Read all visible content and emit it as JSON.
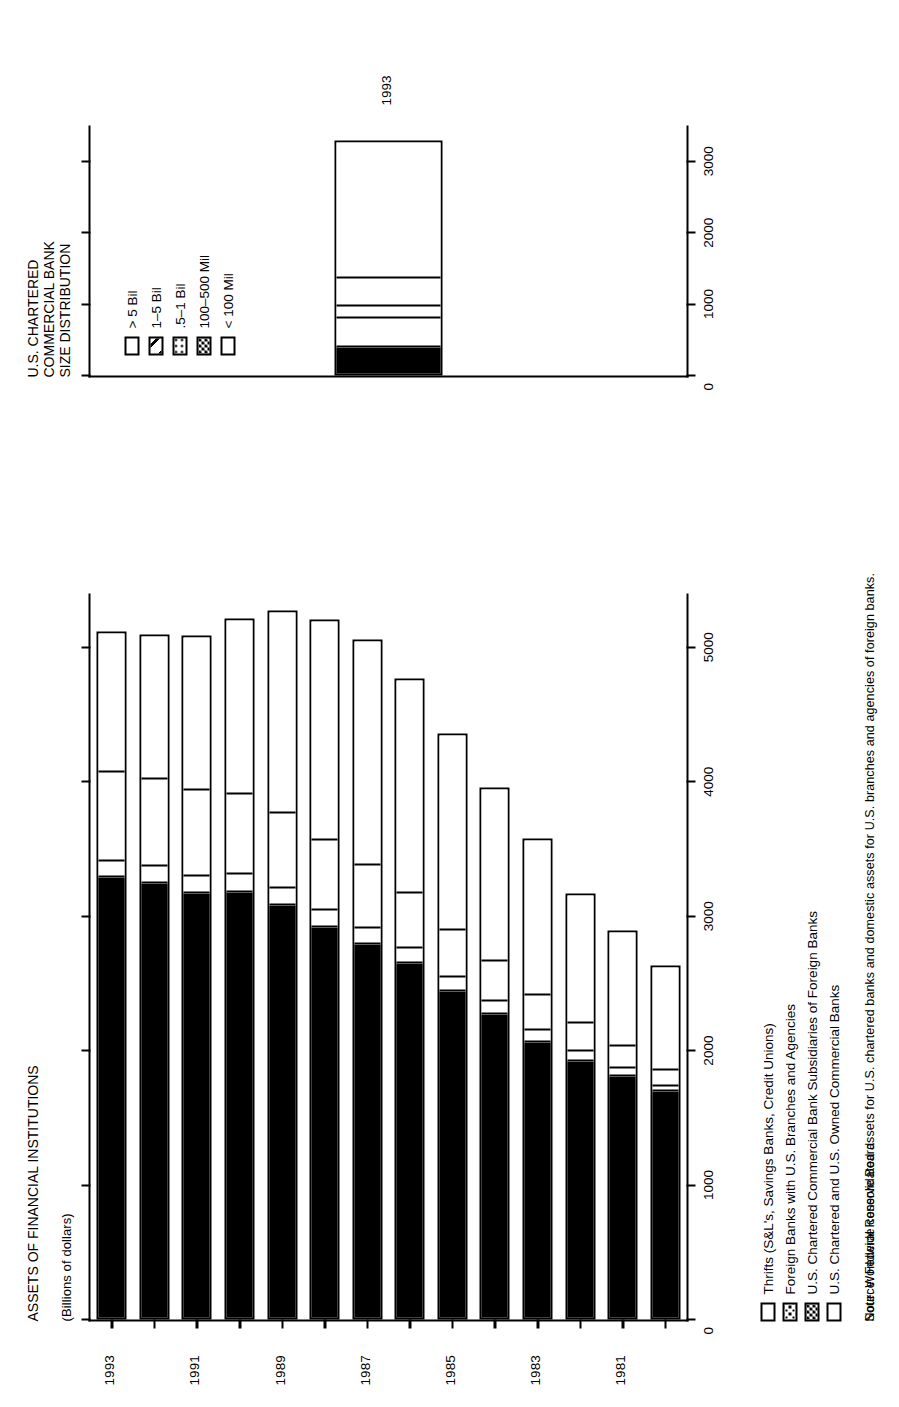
{
  "main_chart": {
    "title_lines": [
      "ASSETS OF FINANCIAL INSTITUTIONS"
    ],
    "subtitle": "(Billions of dollars)",
    "axis_title": "",
    "value_ticks": [
      "0",
      "1000",
      "2000",
      "3000",
      "4000",
      "5000"
    ],
    "year_labels": [
      "1981",
      "1983",
      "1985",
      "1987",
      "1989",
      "1991",
      "1993"
    ],
    "legend": [
      {
        "label": "Thrifts (S&L's, Savings Banks, Credit Unions)",
        "pattern": "open"
      },
      {
        "label": "Foreign Banks with U.S. Branches and Agencies",
        "pattern": "dots2"
      },
      {
        "label": "U.S. Chartered Commercial Bank Subsidiaries of  Foreign Banks",
        "pattern": "checks"
      },
      {
        "label": "U.S. Chartered and U.S. Owned Commercial Banks",
        "pattern": "solid"
      }
    ]
  },
  "secondary_chart": {
    "title_lines": [
      "U.S. CHARTERED",
      "COMMERCIAL BANK",
      "SIZE DISTRIBUTION"
    ],
    "value_ticks": [
      "0",
      "1000",
      "2000",
      "3000"
    ],
    "year_label": "1993",
    "legend": [
      {
        "label": "> 5 Bil",
        "pattern": "open"
      },
      {
        "label": "1–5 Bil",
        "pattern": "hatch"
      },
      {
        "label": ".5–1 Bil",
        "pattern": "dots"
      },
      {
        "label": "100–500 Mil",
        "pattern": "checks"
      },
      {
        "label": "< 100 Mil",
        "pattern": "solid"
      }
    ]
  },
  "footnotes": {
    "note": "Note: Worldwide consolidated assets for U.S. chartered banks and domestic assets for U.S. branches and agencies of foreign banks.",
    "source": "Source: Federal Reserve Board"
  },
  "chart_data": [
    {
      "type": "bar",
      "orientation": "horizontal",
      "stacked": true,
      "title": "Assets of Financial Institutions",
      "subtitle": "(Billions of dollars)",
      "xlabel": "",
      "ylabel": "Billions of dollars",
      "xlim": [
        0,
        5400
      ],
      "ylim": [
        0,
        5400
      ],
      "grid": false,
      "legend_position": "below-left",
      "categories": [
        "1980",
        "1981",
        "1982",
        "1983",
        "1984",
        "1985",
        "1986",
        "1987",
        "1988",
        "1989",
        "1990",
        "1991",
        "1992",
        "1993"
      ],
      "tick_values": [
        0,
        1000,
        2000,
        3000,
        4000,
        5000
      ],
      "labeled_categories": [
        "1981",
        "1983",
        "1985",
        "1987",
        "1989",
        "1991",
        "1993"
      ],
      "series": [
        {
          "name": "U.S. Chartered and U.S. Owned Commercial Banks",
          "pattern": "solid",
          "values": [
            1700,
            1810,
            1920,
            2060,
            2270,
            2440,
            2650,
            2790,
            2920,
            3080,
            3180,
            3170,
            3250,
            3290
          ]
        },
        {
          "name": "U.S. Chartered Commercial Bank Subsidiaries of Foreign Banks",
          "pattern": "checker",
          "values": [
            40,
            60,
            75,
            90,
            100,
            110,
            115,
            120,
            125,
            130,
            135,
            130,
            125,
            120
          ]
        },
        {
          "name": "Foreign Banks with U.S. Branches and Agencies",
          "pattern": "dots",
          "values": [
            120,
            170,
            215,
            265,
            300,
            350,
            410,
            470,
            520,
            560,
            600,
            640,
            650,
            670
          ]
        },
        {
          "name": "Thrifts (S&L's, Savings Banks, Credit Unions)",
          "pattern": "open",
          "values": [
            770,
            850,
            960,
            1160,
            1290,
            1460,
            1590,
            1680,
            1640,
            1500,
            1300,
            1150,
            1070,
            1040
          ]
        }
      ],
      "totals": [
        2630,
        2890,
        3170,
        3575,
        3960,
        4360,
        4765,
        5060,
        5205,
        5270,
        5215,
        5090,
        5095,
        5120
      ]
    },
    {
      "type": "bar",
      "orientation": "horizontal",
      "stacked": true,
      "title": "U.S. Chartered Commercial Bank Size Distribution",
      "xlabel": "",
      "ylabel": "Billions of dollars",
      "xlim": [
        0,
        3500
      ],
      "ylim": [
        0,
        3500
      ],
      "grid": false,
      "legend_position": "inside-top",
      "categories": [
        "1993"
      ],
      "tick_values": [
        0,
        1000,
        2000,
        3000
      ],
      "series": [
        {
          "name": "< 100 Mil",
          "pattern": "solid",
          "values": [
            370
          ]
        },
        {
          "name": "100–500 Mil",
          "pattern": "checker",
          "values": [
            420
          ]
        },
        {
          "name": ".5–1 Bil",
          "pattern": "dots",
          "values": [
            160
          ]
        },
        {
          "name": "1–5 Bil",
          "pattern": "hatch",
          "values": [
            400
          ]
        },
        {
          "name": "> 5 Bil",
          "pattern": "open",
          "values": [
            1940
          ]
        }
      ],
      "total": [
        3290
      ]
    }
  ]
}
